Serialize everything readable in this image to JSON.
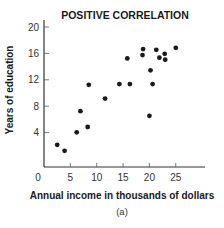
{
  "chart_data": {
    "type": "scatter",
    "title": "POSITIVE CORRELATION",
    "xlabel": "Annual income in thousands of dollars",
    "ylabel": "Years of education",
    "caption": "(a)",
    "xlim": [
      0,
      30
    ],
    "ylim": [
      0,
      20
    ],
    "x_ticks": [
      0,
      5,
      10,
      15,
      20,
      25
    ],
    "y_ticks": [
      4,
      8,
      12,
      16,
      20
    ],
    "grid": false,
    "legend": null,
    "marker_color": "#1a1a1a",
    "points": [
      {
        "x": 2.5,
        "y": 2.6
      },
      {
        "x": 3.9,
        "y": 1.7
      },
      {
        "x": 6.2,
        "y": 4.5
      },
      {
        "x": 6.9,
        "y": 7.7
      },
      {
        "x": 8.3,
        "y": 5.3
      },
      {
        "x": 8.5,
        "y": 11.7
      },
      {
        "x": 11.6,
        "y": 9.6
      },
      {
        "x": 14.3,
        "y": 11.8
      },
      {
        "x": 15.8,
        "y": 15.7
      },
      {
        "x": 16.3,
        "y": 11.8
      },
      {
        "x": 18.7,
        "y": 16.2
      },
      {
        "x": 18.8,
        "y": 17.1
      },
      {
        "x": 20.0,
        "y": 7.0
      },
      {
        "x": 20.2,
        "y": 13.9
      },
      {
        "x": 20.6,
        "y": 11.8
      },
      {
        "x": 21.3,
        "y": 17.0
      },
      {
        "x": 21.9,
        "y": 15.8
      },
      {
        "x": 22.9,
        "y": 16.4
      },
      {
        "x": 23.0,
        "y": 15.5
      },
      {
        "x": 25.0,
        "y": 17.3
      }
    ]
  }
}
